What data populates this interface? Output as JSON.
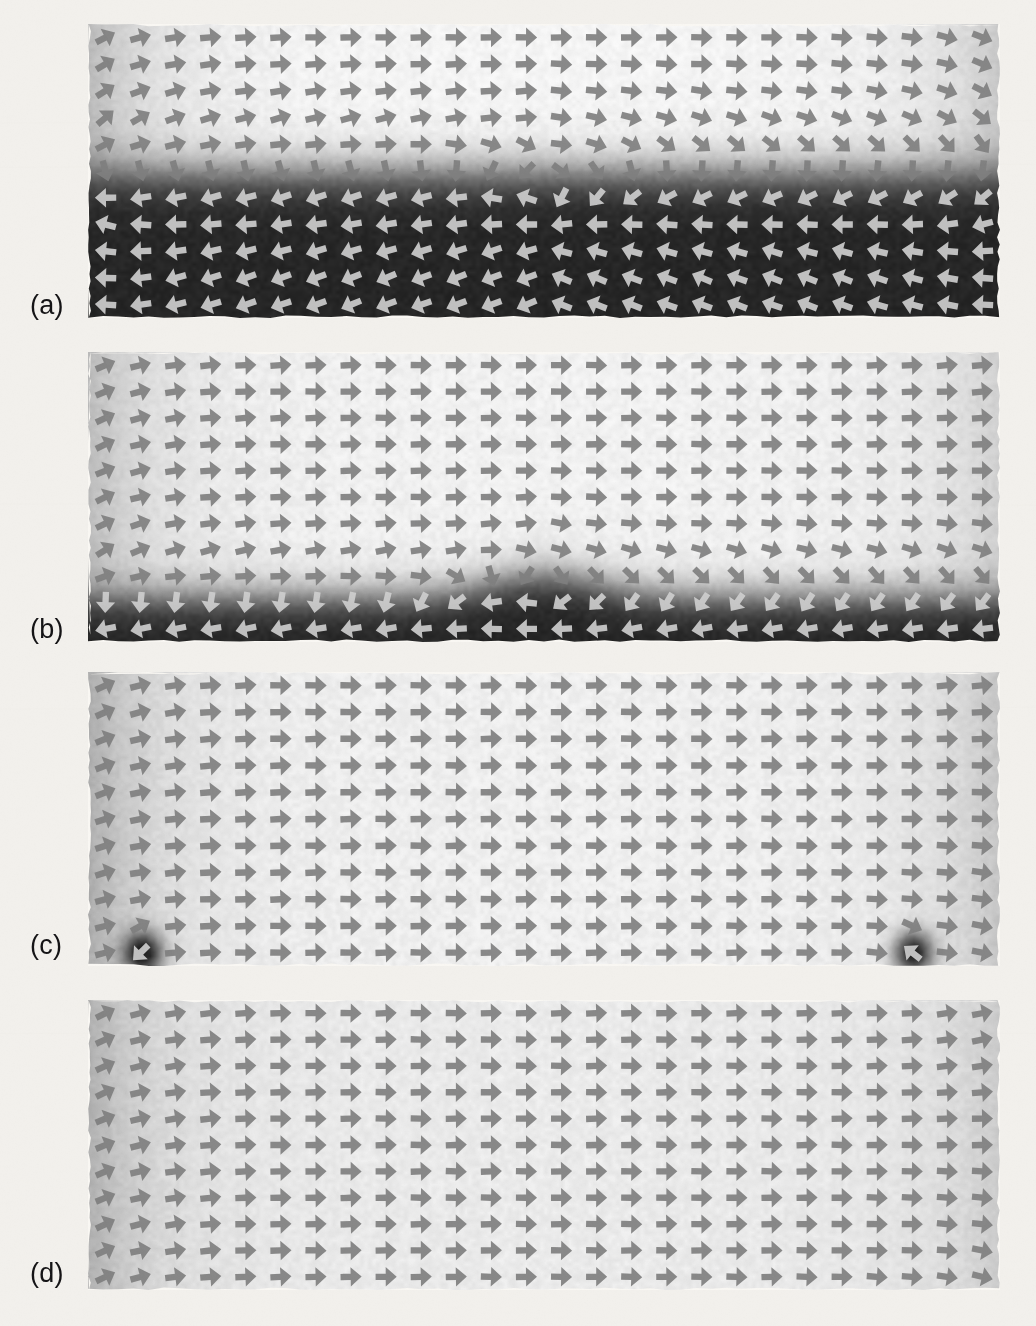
{
  "figure": {
    "background_color": "#f2f0ec",
    "arrow_color": "#7e7e7e",
    "arrow_color_light": "#c9c9c9",
    "label_color": "#19181a",
    "panel_count": 4
  },
  "panels": [
    {
      "id": "a",
      "label": "(a)",
      "label_x": 30,
      "label_y": 290,
      "x": 88,
      "y": 24,
      "width": 912,
      "height": 294,
      "grid_cols": 26,
      "grid_rows": 11,
      "description": "Two oppositely magnetized domains separated by a horizontal wall; lower half dark (m pointing left/down), upper half light (m pointing right/up). Central vertical Bloch-line pinch at mid-width.",
      "wall_fraction": 0.52,
      "notes": "dark band fills lower 48% of panel"
    },
    {
      "id": "b",
      "label": "(b)",
      "label_x": 30,
      "label_y": 614,
      "x": 88,
      "y": 352,
      "width": 912,
      "height": 290,
      "grid_cols": 26,
      "grid_rows": 11,
      "description": "Wall has moved down; only a narrow dark strip remains along the bottom edge with a V-shaped notch near the centre.",
      "wall_fraction": 0.86,
      "notes": "narrow dark band along bottom ~14% of panel, notch dips at centre"
    },
    {
      "id": "c",
      "label": "(c)",
      "label_x": 30,
      "label_y": 930,
      "x": 88,
      "y": 672,
      "width": 912,
      "height": 294,
      "grid_cols": 26,
      "grid_rows": 11,
      "description": "Nearly saturated; uniform rightward magnetization with two small residual dark vortex cores pinned at the bottom-left and bottom-right corners.",
      "wall_fraction": 1.0,
      "notes": "two residual dark corner spots at bottom left and bottom right"
    },
    {
      "id": "d",
      "label": "(d)",
      "label_x": 30,
      "label_y": 1258,
      "x": 88,
      "y": 1000,
      "width": 912,
      "height": 290,
      "grid_cols": 26,
      "grid_rows": 11,
      "description": "Fully saturated single-domain state; all moments point right, with slight canting only at the left and right free edges.",
      "wall_fraction": 1.0,
      "notes": "uniform light grey, faint edge gradients only"
    }
  ],
  "chart_data": {
    "type": "heatmap",
    "subtitle": "Grey level encodes the out-of-plane / transverse magnetization component; arrows show the in-plane magnetization direction",
    "xlabel": "",
    "ylabel": "",
    "grid": false,
    "legend_position": "none",
    "colorscale": {
      "name": "grayscale",
      "min_label": "dark = negative component",
      "max_label": "light = positive component",
      "min_color": "#2b2b2b",
      "max_color": "#f5f4f1"
    },
    "panels": [
      {
        "label": "(a)",
        "state": "two-domain state, wall near mid-height",
        "dark_area_fraction": 0.48,
        "vortex_cores": 1,
        "grid": [
          26,
          11
        ]
      },
      {
        "label": "(b)",
        "state": "wall displaced toward bottom edge",
        "dark_area_fraction": 0.14,
        "vortex_cores": 1,
        "grid": [
          26,
          11
        ]
      },
      {
        "label": "(c)",
        "state": "near saturation, residual corner structures",
        "dark_area_fraction": 0.03,
        "vortex_cores": 2,
        "grid": [
          26,
          11
        ]
      },
      {
        "label": "(d)",
        "state": "saturated single domain",
        "dark_area_fraction": 0.0,
        "vortex_cores": 0,
        "grid": [
          26,
          11
        ]
      }
    ]
  }
}
